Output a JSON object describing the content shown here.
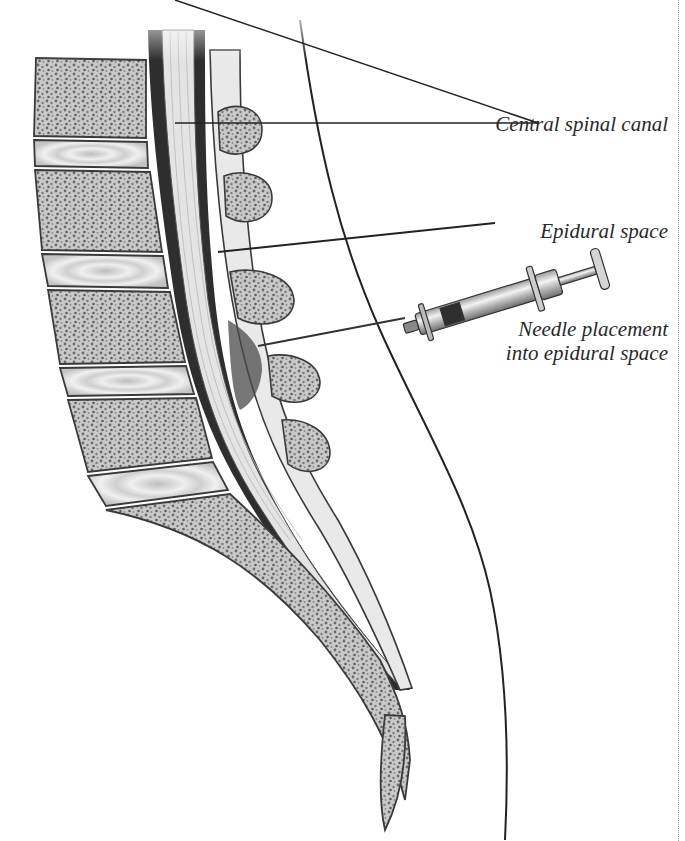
{
  "figure": {
    "labels": {
      "central_spinal_canal": "Central spinal canal",
      "epidural_space": "Epidural space",
      "needle_placement_line1": "Needle placement",
      "needle_placement_line2": "into epidural space"
    },
    "colors": {
      "background": "#ffffff",
      "bone_fill": "#cfcfcf",
      "bone_speckle": "#6e6e6e",
      "disc_fill": "#dcdcdc",
      "canal_dark": "#2e2e2e",
      "cord_fill": "#e6e6e6",
      "outline": "#3a3a3a",
      "label_text": "#2a2a2a"
    }
  }
}
